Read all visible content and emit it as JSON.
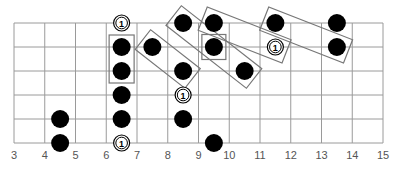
{
  "diagram": {
    "type": "guitar-fretboard",
    "fret_start": 3,
    "fret_end": 15,
    "fret_labels": [
      "3",
      "4",
      "5",
      "6",
      "7",
      "8",
      "9",
      "10",
      "11",
      "12",
      "13",
      "14",
      "15"
    ],
    "strings": 6,
    "colors": {
      "grid": "#9a9a9a",
      "dot": "#000000",
      "box": "#777777",
      "ring": "#000000",
      "label": "#555555"
    },
    "root_label": "1",
    "dots": [
      {
        "string": 1,
        "pos": 8.5
      },
      {
        "string": 1,
        "pos": 9.5
      },
      {
        "string": 1,
        "pos": 11.5
      },
      {
        "string": 1,
        "pos": 13.5
      },
      {
        "string": 2,
        "pos": 6.5
      },
      {
        "string": 2,
        "pos": 7.5
      },
      {
        "string": 2,
        "pos": 9.5
      },
      {
        "string": 2,
        "pos": 13.5
      },
      {
        "string": 3,
        "pos": 6.5
      },
      {
        "string": 3,
        "pos": 8.5
      },
      {
        "string": 3,
        "pos": 10.5
      },
      {
        "string": 4,
        "pos": 6.5
      },
      {
        "string": 5,
        "pos": 4.5
      },
      {
        "string": 5,
        "pos": 6.5
      },
      {
        "string": 5,
        "pos": 8.5
      },
      {
        "string": 6,
        "pos": 4.5
      },
      {
        "string": 6,
        "pos": 9.5
      }
    ],
    "roots": [
      {
        "string": 1,
        "pos": 6.5
      },
      {
        "string": 2,
        "pos": 11.5
      },
      {
        "string": 4,
        "pos": 8.5
      },
      {
        "string": 6,
        "pos": 6.5
      }
    ],
    "boxes": [
      {
        "from": {
          "string": 2,
          "pos": 6.5
        },
        "to": {
          "string": 3,
          "pos": 6.5
        }
      },
      {
        "from": {
          "string": 2,
          "pos": 7.5
        },
        "to": {
          "string": 3,
          "pos": 8.5
        }
      },
      {
        "from": {
          "string": 1,
          "pos": 8.5
        },
        "to": {
          "string": 3,
          "pos": 10.5
        }
      },
      {
        "from": {
          "string": 1,
          "pos": 9.5
        },
        "to": {
          "string": 2,
          "pos": 11.5
        }
      },
      {
        "from": {
          "string": 1,
          "pos": 11.5
        },
        "to": {
          "string": 2,
          "pos": 13.5
        }
      },
      {
        "from": {
          "string": 2,
          "pos": 9.5
        },
        "to": {
          "string": 2,
          "pos": 9.5
        }
      }
    ]
  }
}
